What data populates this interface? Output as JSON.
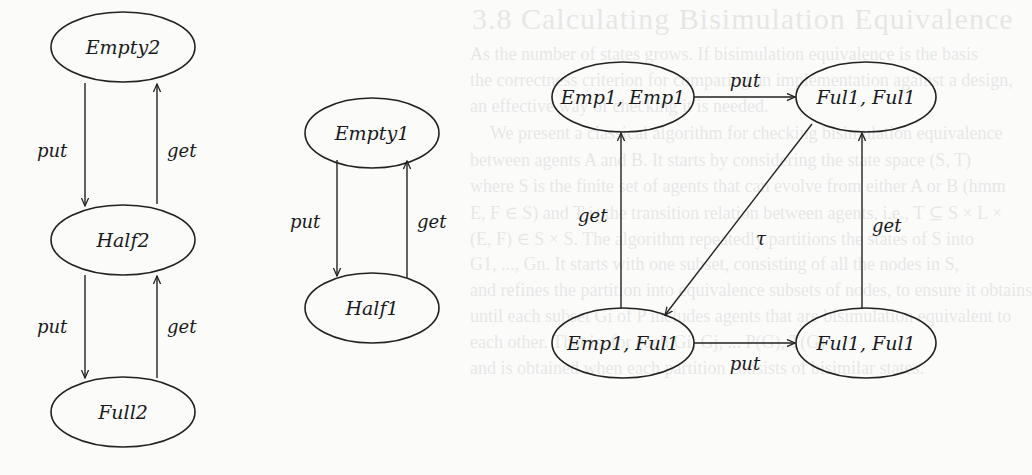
{
  "background_text": {
    "title": "3.8 Calculating Bisimulation Equivalence",
    "lines": [
      "As the number of states grows. If bisimulation equivalence is the basis",
      "the correctness criterion for comparing an implementation against a design,",
      "an effective way of checking it is needed.",
      "We present a classical algorithm for checking bisimulation equivalence",
      "between agents A and B. It starts by considering the state space (S, T)",
      "where S is the finite set of agents that can evolve from either A or B (hmm",
      "E, F ∈ S) and T is the transition relation between agents, i.e., T ⊆ S × L ×",
      "(E, F) ∈ S × S. The algorithm repeatedly partitions the states of S into",
      "G1, ..., Gn. It starts with one subset, consisting of all the nodes in S,",
      "and refines the partition into equivalence subsets of nodes, to ensure it obtains",
      "until each subset Gi of P includes agents that are bisimulation equivalent to",
      "each other. That is, for each Gi, Gj, ... P(G), T(G)",
      "and is obtained when each partition consists of bisimilar states."
    ]
  },
  "diagram": {
    "graphs": [
      {
        "id": "two-place-buffer",
        "nodes": [
          {
            "id": "empty2",
            "label": "Empty2"
          },
          {
            "id": "half2",
            "label": "Half2"
          },
          {
            "id": "full2",
            "label": "Full2"
          }
        ],
        "edges": [
          {
            "from": "Empty2",
            "to": "Half2",
            "label": "put"
          },
          {
            "from": "Half2",
            "to": "Empty2",
            "label": "get"
          },
          {
            "from": "Half2",
            "to": "Full2",
            "label": "put"
          },
          {
            "from": "Full2",
            "to": "Half2",
            "label": "get"
          }
        ]
      },
      {
        "id": "one-place-buffer",
        "nodes": [
          {
            "id": "empty1",
            "label": "Empty1"
          },
          {
            "id": "half1",
            "label": "Half1"
          }
        ],
        "edges": [
          {
            "from": "Empty1",
            "to": "Half1",
            "label": "put"
          },
          {
            "from": "Half1",
            "to": "Empty1",
            "label": "get"
          }
        ]
      },
      {
        "id": "composed-buffer",
        "nodes": [
          {
            "id": "emp1-emp1",
            "label": "Emp1, Emp1"
          },
          {
            "id": "ful1-ful1-top",
            "label": "Ful1, Ful1"
          },
          {
            "id": "emp1-ful1",
            "label": "Emp1, Ful1"
          },
          {
            "id": "ful1-ful1-bottom",
            "label": "Ful1, Ful1"
          }
        ],
        "edges": [
          {
            "from": "Emp1, Emp1",
            "to": "Ful1, Ful1 (top)",
            "label": "put"
          },
          {
            "from": "Ful1, Ful1 (top)",
            "to": "Emp1, Ful1",
            "label": "τ"
          },
          {
            "from": "Emp1, Ful1",
            "to": "Emp1, Emp1",
            "label": "get"
          },
          {
            "from": "Emp1, Ful1",
            "to": "Ful1, Ful1 (bottom)",
            "label": "put"
          },
          {
            "from": "Ful1, Ful1 (bottom)",
            "to": "Ful1, Ful1 (top)",
            "label": "get"
          }
        ]
      }
    ],
    "labels": {
      "put": "put",
      "get": "get",
      "tau": "τ"
    }
  }
}
